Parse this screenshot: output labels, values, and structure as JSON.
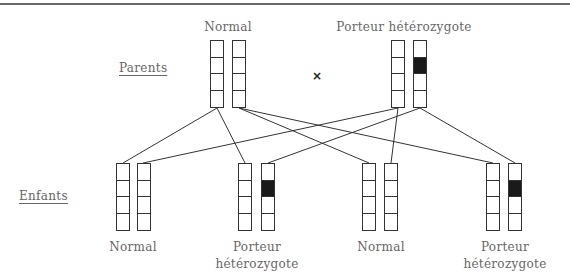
{
  "labels": {
    "parents": "Parents",
    "children": "Enfants",
    "cross_symbol": "×"
  },
  "parents": [
    {
      "label": "Normal",
      "chromosomes": [
        {
          "dark_segment": null
        },
        {
          "dark_segment": null
        }
      ]
    },
    {
      "label": "Porteur hétérozygote",
      "chromosomes": [
        {
          "dark_segment": null
        },
        {
          "dark_segment": 1
        }
      ]
    }
  ],
  "children": [
    {
      "label_line1": "Normal",
      "label_line2": "",
      "chromosomes": [
        {
          "dark_segment": null
        },
        {
          "dark_segment": null
        }
      ]
    },
    {
      "label_line1": "Porteur",
      "label_line2": "hétérozygote",
      "chromosomes": [
        {
          "dark_segment": null
        },
        {
          "dark_segment": 1
        }
      ]
    },
    {
      "label_line1": "Normal",
      "label_line2": "",
      "chromosomes": [
        {
          "dark_segment": null
        },
        {
          "dark_segment": null
        }
      ]
    },
    {
      "label_line1": "Porteur",
      "label_line2": "hétérozygote",
      "chromosomes": [
        {
          "dark_segment": null
        },
        {
          "dark_segment": 1
        }
      ]
    }
  ],
  "colors": {
    "line": "#333333",
    "dark_segment": "#1a1a1a",
    "text": "#666666"
  }
}
